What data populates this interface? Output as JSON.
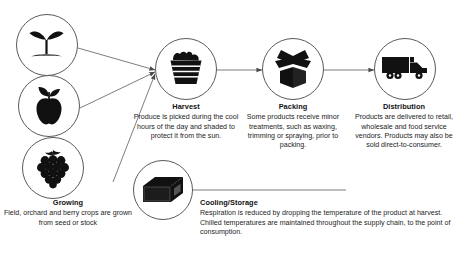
{
  "diagram": {
    "background_color": "#ffffff",
    "line_color": "#6e6e6e",
    "icon_color": "#111111"
  },
  "inputs": [
    {
      "id": "seedling",
      "icon": "seedling-icon"
    },
    {
      "id": "apple",
      "icon": "apple-icon"
    },
    {
      "id": "grapes",
      "icon": "grapes-icon"
    }
  ],
  "growing": {
    "title": "Growing",
    "body": "Field, orchard and berry crops are grown from seed or stock"
  },
  "stages": [
    {
      "id": "harvest",
      "icon": "basket-icon",
      "title": "Harvest",
      "body": "Produce is picked during the cool hours of the day and shaded to protect it from the sun."
    },
    {
      "id": "packing",
      "icon": "open-box-icon",
      "title": "Packing",
      "body": "Some products receive minor treatments, such as waxing, trimming or spraying, prior to packing."
    },
    {
      "id": "distribution",
      "icon": "truck-icon",
      "title": "Distribution",
      "body": "Products are delivered to retail, wholesale and food service vendors. Products may also be sold direct-to-consumer."
    }
  ],
  "cooling": {
    "id": "cooling-storage",
    "icon": "crate-icon",
    "title": "Cooling/Storage",
    "body": "Respiration is reduced by dropping the temperature of the product at harvest. Chilled temperatures are maintained throughout the supply chain, to the point of consumption."
  }
}
